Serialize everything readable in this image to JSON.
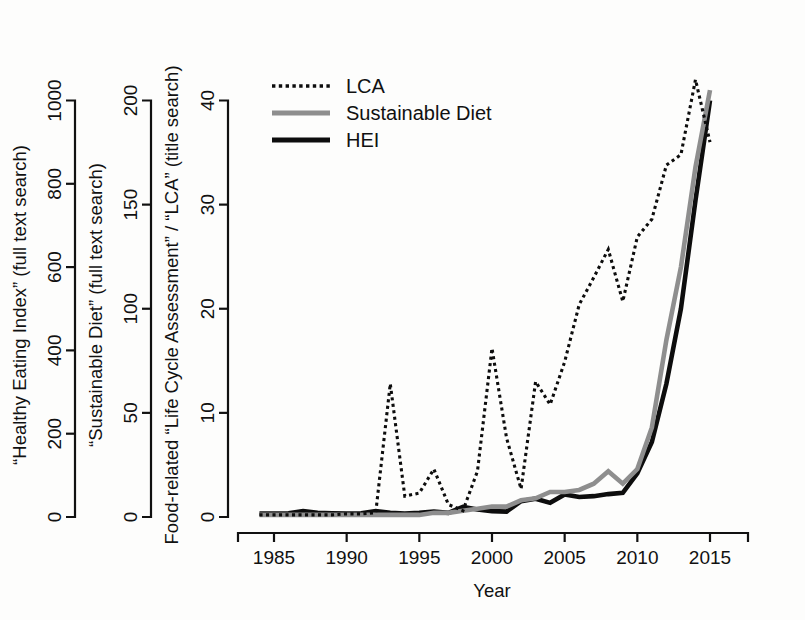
{
  "chart_data": {
    "type": "line",
    "title": "",
    "xlabel": "Year",
    "x": [
      1984,
      1985,
      1986,
      1987,
      1988,
      1989,
      1990,
      1991,
      1992,
      1993,
      1994,
      1995,
      1996,
      1997,
      1998,
      1999,
      2000,
      2001,
      2002,
      2003,
      2004,
      2005,
      2006,
      2007,
      2008,
      2009,
      2010,
      2011,
      2012,
      2013,
      2014,
      2015
    ],
    "xlim": [
      1983.5,
      2015.5
    ],
    "grid": false,
    "legend_position": "top-left-inside",
    "axes": [
      {
        "id": "hei",
        "title": "“Healthy Eating Index” (full text search)",
        "ticks": [
          0,
          200,
          400,
          600,
          800,
          1000
        ],
        "lim": [
          0,
          1090
        ],
        "position": "left-outer"
      },
      {
        "id": "sustainable_diet",
        "title": "“Sustainable Diet” (full text search)",
        "ticks": [
          0,
          50,
          100,
          150,
          200
        ],
        "lim": [
          0,
          218
        ],
        "position": "left-middle"
      },
      {
        "id": "lca",
        "title": "Food-related “Life Cycle Assessment” / “LCA” (title search)",
        "ticks": [
          0,
          10,
          20,
          30,
          40
        ],
        "lim": [
          0,
          43.6
        ],
        "position": "left-inner"
      }
    ],
    "series": [
      {
        "name": "LCA",
        "axis": "lca",
        "style": "dotted",
        "color": "#0d0d0d",
        "values": [
          0.2,
          0.2,
          0.2,
          0.2,
          0.2,
          0.2,
          0.3,
          0.3,
          0.4,
          12.8,
          2.0,
          2.3,
          4.6,
          1.2,
          0.6,
          4.4,
          16.2,
          7.6,
          2.7,
          13.0,
          10.8,
          14.9,
          20.4,
          23.0,
          25.7,
          20.7,
          26.9,
          28.6,
          33.8,
          34.8,
          42.0,
          36.0
        ]
      },
      {
        "name": "Sustainable Diet",
        "axis": "sustainable_diet",
        "style": "solid",
        "color": "#8e8e8e",
        "values": [
          1,
          1,
          1,
          1,
          1,
          1,
          1,
          1,
          1,
          1,
          1,
          1,
          2,
          2,
          3,
          4,
          5,
          5,
          8,
          9,
          12,
          12,
          13,
          16,
          22,
          16,
          23,
          43,
          85,
          120,
          168,
          205
        ]
      },
      {
        "name": "HEI",
        "axis": "hei",
        "style": "solid",
        "color": "#0d0d0d",
        "values": [
          8,
          8,
          9,
          14,
          10,
          9,
          8,
          9,
          14,
          10,
          8,
          10,
          13,
          10,
          24,
          18,
          14,
          13,
          38,
          44,
          34,
          54,
          48,
          50,
          55,
          58,
          105,
          180,
          320,
          500,
          760,
          1000
        ]
      }
    ],
    "xticks": [
      1985,
      1990,
      1995,
      2000,
      2005,
      2010,
      2015
    ]
  },
  "legend": {
    "items": [
      {
        "label": "LCA",
        "key": "dotted-line-key"
      },
      {
        "label": "Sustainable Diet",
        "key": "gray-line-key"
      },
      {
        "label": "HEI",
        "key": "black-line-key"
      }
    ]
  },
  "colors": {
    "lca": "#0d0d0d",
    "sustainable_diet": "#8e8e8e",
    "hei": "#0d0d0d",
    "axis": "#111111",
    "background": "#fdfdfc"
  }
}
